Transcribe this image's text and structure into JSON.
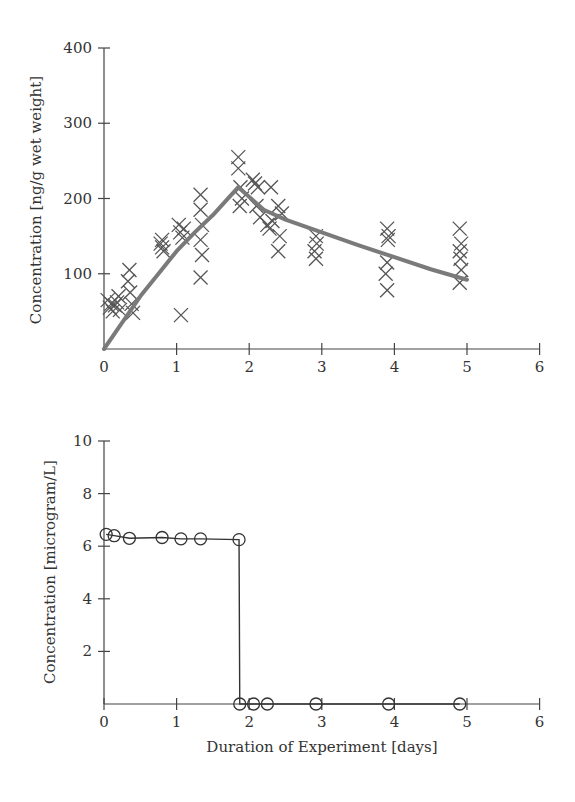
{
  "chart_data": [
    {
      "type": "scatter",
      "title": "",
      "xlabel": "",
      "ylabel": "Concentration [ng/g wet weight]",
      "xlim": [
        0,
        6
      ],
      "ylim": [
        0,
        400
      ],
      "xticks": [
        0,
        1,
        2,
        3,
        4,
        5,
        6
      ],
      "yticks": [
        100,
        200,
        300,
        400
      ],
      "grid": false,
      "legend": null,
      "series": [
        {
          "name": "Measured tissue concentration",
          "marker": "x",
          "points": [
            [
              0.05,
              65
            ],
            [
              0.08,
              55
            ],
            [
              0.1,
              60
            ],
            [
              0.12,
              50
            ],
            [
              0.15,
              58
            ],
            [
              0.18,
              62
            ],
            [
              0.2,
              70
            ],
            [
              0.22,
              52
            ],
            [
              0.35,
              105
            ],
            [
              0.33,
              90
            ],
            [
              0.36,
              75
            ],
            [
              0.38,
              60
            ],
            [
              0.4,
              48
            ],
            [
              0.8,
              145
            ],
            [
              0.8,
              135
            ],
            [
              0.82,
              130
            ],
            [
              0.78,
              140
            ],
            [
              1.03,
              165
            ],
            [
              1.05,
              155
            ],
            [
              1.08,
              148
            ],
            [
              1.1,
              160
            ],
            [
              1.06,
              45
            ],
            [
              1.33,
              205
            ],
            [
              1.33,
              185
            ],
            [
              1.35,
              165
            ],
            [
              1.33,
              145
            ],
            [
              1.35,
              125
            ],
            [
              1.33,
              95
            ],
            [
              1.85,
              255
            ],
            [
              1.85,
              240
            ],
            [
              1.88,
              215
            ],
            [
              1.9,
              200
            ],
            [
              1.87,
              190
            ],
            [
              2.05,
              225
            ],
            [
              2.08,
              220
            ],
            [
              2.12,
              215
            ],
            [
              2.1,
              190
            ],
            [
              2.15,
              175
            ],
            [
              2.3,
              215
            ],
            [
              2.25,
              165
            ],
            [
              2.28,
              160
            ],
            [
              2.32,
              170
            ],
            [
              2.4,
              190
            ],
            [
              2.45,
              180
            ],
            [
              2.42,
              150
            ],
            [
              2.4,
              130
            ],
            [
              2.92,
              150
            ],
            [
              2.93,
              140
            ],
            [
              2.9,
              130
            ],
            [
              2.92,
              120
            ],
            [
              3.9,
              160
            ],
            [
              3.92,
              150
            ],
            [
              3.91,
              145
            ],
            [
              3.9,
              115
            ],
            [
              3.88,
              100
            ],
            [
              3.9,
              78
            ],
            [
              4.9,
              160
            ],
            [
              4.92,
              140
            ],
            [
              4.9,
              130
            ],
            [
              4.91,
              120
            ],
            [
              4.92,
              105
            ],
            [
              4.9,
              88
            ]
          ]
        },
        {
          "name": "Model fit",
          "type": "line",
          "x": [
            0,
            0.25,
            0.5,
            0.75,
            1.0,
            1.25,
            1.5,
            1.85,
            2.2,
            2.5,
            3.0,
            3.5,
            4.0,
            4.5,
            5.0
          ],
          "y": [
            0,
            35,
            70,
            100,
            130,
            155,
            178,
            215,
            185,
            172,
            155,
            138,
            122,
            106,
            92
          ]
        }
      ]
    },
    {
      "type": "line",
      "title": "",
      "xlabel": "Duration of Experiment [days]",
      "ylabel": "Concentration [microgram/L]",
      "xlim": [
        0,
        6
      ],
      "ylim": [
        0,
        10
      ],
      "xticks": [
        0,
        1,
        2,
        3,
        4,
        5,
        6
      ],
      "yticks": [
        2,
        4,
        6,
        8,
        10
      ],
      "grid": false,
      "legend": null,
      "series": [
        {
          "name": "Water concentration",
          "marker": "o",
          "x": [
            0.03,
            0.14,
            0.35,
            0.8,
            1.06,
            1.33,
            1.86,
            1.87,
            2.06,
            2.25,
            2.92,
            3.92,
            4.9
          ],
          "y": [
            6.45,
            6.4,
            6.3,
            6.33,
            6.28,
            6.28,
            6.25,
            0,
            0,
            0,
            0,
            0,
            0
          ]
        }
      ]
    }
  ],
  "top": {
    "ylabel": "Concentration [ng/g wet weight]",
    "yticks": [
      "100",
      "200",
      "300",
      "400"
    ],
    "xticks": [
      "0",
      "1",
      "2",
      "3",
      "4",
      "5",
      "6"
    ]
  },
  "bottom": {
    "ylabel": "Concentration [microgram/L]",
    "xlabel": "Duration of Experiment [days]",
    "yticks": [
      "2",
      "4",
      "6",
      "8",
      "10"
    ],
    "xticks": [
      "0",
      "1",
      "2",
      "3",
      "4",
      "5",
      "6"
    ]
  }
}
